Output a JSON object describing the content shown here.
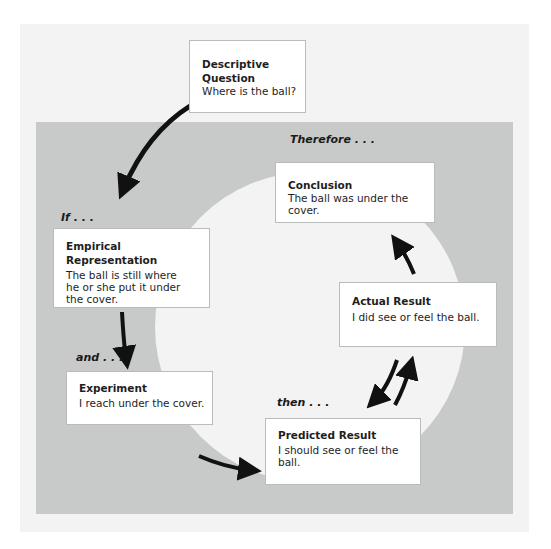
{
  "diagram": {
    "colors": {
      "outer_panel": "#f2f3f2",
      "gray_panel": "#c7cac8",
      "circle": "#f2f3f2",
      "box": "#ffffff",
      "arrow": "#111111"
    },
    "connectors": {
      "if": "If . . .",
      "and": "and . . .",
      "then": "then . . .",
      "therefore": "Therefore . . ."
    },
    "boxes": {
      "descriptive_question": {
        "title": "Descriptive Question",
        "body": "Where is the ball?"
      },
      "empirical_representation": {
        "title": "Empirical Representation",
        "body": "The ball is still where he or she put it under the cover."
      },
      "experiment": {
        "title": "Experiment",
        "body": "I reach under the cover."
      },
      "predicted_result": {
        "title": "Predicted Result",
        "body": "I should see or feel the ball."
      },
      "actual_result": {
        "title": "Actual Result",
        "body": "I did see or feel the ball."
      },
      "conclusion": {
        "title": "Conclusion",
        "body": "The ball was under the cover."
      }
    },
    "edges": [
      {
        "from": "Descriptive Question",
        "to": "Empirical Representation",
        "label": "If . . ."
      },
      {
        "from": "Empirical Representation",
        "to": "Experiment",
        "label": "and . . ."
      },
      {
        "from": "Experiment",
        "to": "Predicted Result",
        "label": "then . . ."
      },
      {
        "from": "Predicted Result",
        "to": "Actual Result",
        "label": ""
      },
      {
        "from": "Actual Result",
        "to": "Predicted Result",
        "label": ""
      },
      {
        "from": "Actual Result",
        "to": "Conclusion",
        "label": "Therefore . . ."
      }
    ]
  }
}
